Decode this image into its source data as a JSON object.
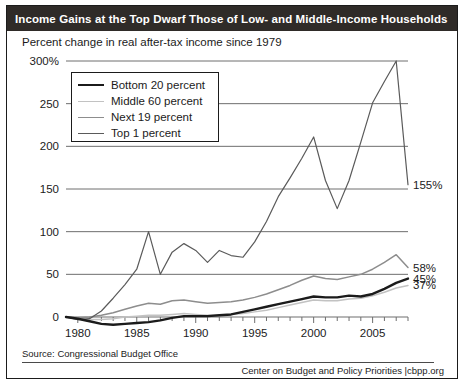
{
  "header": {
    "title": "Income Gains at the Top Dwarf Those of Low- and Middle-Income Households",
    "bar_color": "#2f2b28",
    "text_color": "#ffffff"
  },
  "subtitle": "Percent change in real after-tax income since 1979",
  "footer": {
    "source": "Source: Congressional Budget Office",
    "credit": "Center on Budget and Policy Priorities |cbpp.org"
  },
  "legend": {
    "position": "top-left-inside",
    "items": [
      {
        "label": "Bottom 20 percent",
        "color": "#1b1b1b",
        "width": 2.6
      },
      {
        "label": "Middle 60 percent",
        "color": "#c2c2c2",
        "width": 1.6
      },
      {
        "label": "Next 19 percent",
        "color": "#8d8d8d",
        "width": 1.6
      },
      {
        "label": "Top 1 percent",
        "color": "#5a5a5a",
        "width": 1.3
      }
    ]
  },
  "axes": {
    "y_ticks": [
      "0",
      "50",
      "100",
      "150",
      "200",
      "250",
      "300%"
    ],
    "y_values": [
      0,
      50,
      100,
      150,
      200,
      250,
      300
    ],
    "x_ticks": [
      "1980",
      "1985",
      "1990",
      "1995",
      "2000",
      "2005"
    ],
    "x_tick_values": [
      1980,
      1985,
      1990,
      1995,
      2000,
      2005
    ],
    "xlim": [
      1979,
      2008
    ],
    "ylim": [
      -12,
      300
    ],
    "grid": "horizontal"
  },
  "end_labels": [
    {
      "text": "155%",
      "series": "Top 1 percent",
      "value": 155
    },
    {
      "text": "58%",
      "series": "Next 19 percent",
      "value": 58
    },
    {
      "text": "45%",
      "series": "Bottom 20 percent",
      "value": 45
    },
    {
      "text": "37%",
      "series": "Middle 60 percent",
      "value": 37
    }
  ],
  "chart_data": {
    "type": "line",
    "title": "Income Gains at the Top Dwarf Those of Low- and Middle-Income Households",
    "subtitle": "Percent change in real after-tax income since 1979",
    "xlabel": "",
    "ylabel": "Percent change in real after-tax income since 1979",
    "xlim": [
      1979,
      2008
    ],
    "ylim": [
      -12,
      300
    ],
    "grid": true,
    "legend_position": "upper left",
    "source": "Congressional Budget Office",
    "x": [
      1979,
      1980,
      1981,
      1982,
      1983,
      1984,
      1985,
      1986,
      1987,
      1988,
      1989,
      1990,
      1991,
      1992,
      1993,
      1994,
      1995,
      1996,
      1997,
      1998,
      1999,
      2000,
      2001,
      2002,
      2003,
      2004,
      2005,
      2006,
      2007,
      2008
    ],
    "series": [
      {
        "name": "Bottom 20 percent",
        "color": "#1b1b1b",
        "final_value": 45,
        "values": [
          0,
          -2,
          -5,
          -8,
          -9,
          -8,
          -7,
          -6,
          -4,
          -1,
          1,
          1,
          1,
          2,
          3,
          6,
          9,
          12,
          15,
          18,
          21,
          24,
          23,
          23,
          25,
          24,
          27,
          33,
          40,
          45
        ]
      },
      {
        "name": "Middle 60 percent",
        "color": "#c2c2c2",
        "final_value": 37,
        "values": [
          0,
          -2,
          -3,
          -3,
          -2,
          0,
          1,
          2,
          2,
          3,
          4,
          3,
          2,
          2,
          3,
          4,
          6,
          8,
          11,
          14,
          17,
          20,
          19,
          19,
          21,
          22,
          25,
          29,
          34,
          37
        ]
      },
      {
        "name": "Next 19 percent",
        "color": "#8d8d8d",
        "final_value": 58,
        "values": [
          0,
          -1,
          0,
          2,
          5,
          9,
          13,
          16,
          15,
          19,
          20,
          18,
          16,
          17,
          18,
          20,
          23,
          27,
          32,
          37,
          43,
          48,
          45,
          44,
          47,
          50,
          56,
          64,
          73,
          58
        ]
      },
      {
        "name": "Top 1 percent",
        "color": "#5a5a5a",
        "final_value": 155,
        "values": [
          0,
          -3,
          -2,
          7,
          22,
          38,
          56,
          100,
          50,
          76,
          86,
          78,
          64,
          78,
          72,
          70,
          88,
          112,
          141,
          163,
          186,
          211,
          160,
          127,
          160,
          205,
          251,
          276,
          300,
          155
        ]
      }
    ]
  }
}
